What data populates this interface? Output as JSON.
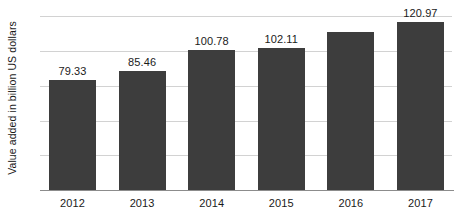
{
  "chart_data": {
    "type": "bar",
    "title": "",
    "subtitle": "",
    "xlabel": "",
    "ylabel": "Value added in billion US dollars",
    "categories": [
      "2012",
      "2013",
      "2014",
      "2015",
      "2016",
      "2017"
    ],
    "values": [
      79.33,
      85.46,
      100.78,
      102.11,
      113.7,
      120.97
    ],
    "data_labels": [
      "79.33",
      "85.46",
      "100.78",
      "102.11",
      "",
      "120.97"
    ],
    "series": [
      {
        "name": "Value added",
        "values": [
          79.33,
          85.46,
          100.78,
          102.11,
          113.7,
          120.97
        ]
      }
    ],
    "ylim": [
      0,
      131
    ],
    "y_gridline_values": [
      25,
      50,
      75,
      100,
      125
    ],
    "grid": true,
    "y_tick_labels_visible": false,
    "legend": false,
    "legend_position": "none",
    "bar_color": "#3d3d3d",
    "gridline_color": "#d2d2d2",
    "axis_color": "#8c8c8c",
    "background_color": "#ffffff",
    "text_color": "#1a1a1a"
  }
}
